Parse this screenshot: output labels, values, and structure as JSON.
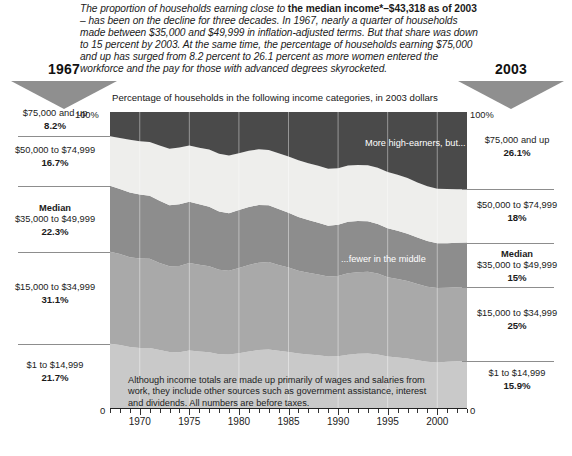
{
  "intro": {
    "part1": "The proportion of households earning close to ",
    "bold1": "the median income*–$43,318 as of 2003",
    "part2": " – has been on the decline for three decades. In 1967, nearly a quarter of households made between $35,000 and $49,999 in inflation-adjusted terms. But that share was down to 15 percent by 2003. At the same time, the percentage of households earning $75,000 and up has surged from 8.2 percent to 26.1 percent as more women entered the workforce and the pay for those with advanced degrees skyrocketed."
  },
  "header": {
    "left_year": "1967",
    "right_year": "2003",
    "caption": "Percentage of households in the following income categories, in 2003 dollars"
  },
  "axis": {
    "top_left": "100%",
    "top_right": "100%",
    "zero_left": "0",
    "zero_right": "0",
    "x_labels": [
      "1970",
      "1975",
      "1980",
      "1985",
      "1990",
      "1995",
      "2000"
    ],
    "x_label_years": [
      1970,
      1975,
      1980,
      1985,
      1990,
      1995,
      2000
    ]
  },
  "annotations": {
    "high_earners": "More high-earners, but...",
    "fewer_middle": "...fewer in the middle",
    "footnote": "Although income totals are made up primarily of wages and salaries from work, they include other sources such as government assistance, interest and dividends. All numbers are before taxes."
  },
  "legend_left": [
    {
      "name": "$75,000 and up",
      "value": "8.2%",
      "median": false
    },
    {
      "name": "$50,000 to $74,999",
      "value": "16.7%",
      "median": false
    },
    {
      "name": "$35,000 to $49,999",
      "value": "22.3%",
      "median": true,
      "median_label": "Median"
    },
    {
      "name": "$15,000 to $34,999",
      "value": "31.1%",
      "median": false
    },
    {
      "name": "$1 to $14,999",
      "value": "21.7%",
      "median": false
    }
  ],
  "legend_right": [
    {
      "name": "$75,000 and up",
      "value": "26.1%",
      "median": false
    },
    {
      "name": "$50,000 to $74,999",
      "value": "18%",
      "median": false
    },
    {
      "name": "$35,000 to $49,999",
      "value": "15%",
      "median": true,
      "median_label": "Median"
    },
    {
      "name": "$15,000 to $34,999",
      "value": "25%",
      "median": false
    },
    {
      "name": "$1 to $14,999",
      "value": "15.9%",
      "median": false
    }
  ],
  "colors": {
    "band_75k_up": "#4a4a4a",
    "band_50k_75k": "#eeeeec",
    "band_35k_50k": "#8d8d8d",
    "band_15k_35k": "#a9a9a9",
    "band_1_15k": "#c9c9c9",
    "triangle": "#8f8f8f",
    "separator": "#8d8d8d"
  },
  "chart_data": {
    "type": "area",
    "title": "Percentage of households in the following income categories, in 2003 dollars",
    "xlabel": "",
    "ylabel": "",
    "stacked": true,
    "normalized_percent": true,
    "ylim": [
      0,
      100
    ],
    "xlim": [
      1967,
      2003
    ],
    "grid": true,
    "legend_position": "outside-left-and-right",
    "x": [
      1967,
      1968,
      1969,
      1970,
      1971,
      1972,
      1973,
      1974,
      1975,
      1976,
      1977,
      1978,
      1979,
      1980,
      1981,
      1982,
      1983,
      1984,
      1985,
      1986,
      1987,
      1988,
      1989,
      1990,
      1991,
      1992,
      1993,
      1994,
      1995,
      1996,
      1997,
      1998,
      1999,
      2000,
      2001,
      2002,
      2003
    ],
    "series": [
      {
        "name": "$1 to $14,999",
        "color": "#c9c9c9",
        "start_value": 21.7,
        "end_value": 15.9,
        "values": [
          21.7,
          21.3,
          20.6,
          20.3,
          20.3,
          19.6,
          18.9,
          18.8,
          19.4,
          19.1,
          18.8,
          18.2,
          18.1,
          18.5,
          19.1,
          19.6,
          19.8,
          19.3,
          18.9,
          18.4,
          18.1,
          17.8,
          17.4,
          17.5,
          18.0,
          18.3,
          18.4,
          18.1,
          17.4,
          17.1,
          16.7,
          16.1,
          15.6,
          15.4,
          15.6,
          15.8,
          15.9
        ]
      },
      {
        "name": "$15,000 to $34,999",
        "color": "#a9a9a9",
        "start_value": 31.1,
        "end_value": 25.0,
        "values": [
          31.1,
          30.7,
          30.3,
          30.2,
          30.1,
          29.4,
          29.0,
          29.2,
          29.6,
          29.3,
          29.1,
          28.5,
          28.3,
          28.8,
          29.2,
          29.5,
          29.5,
          29.0,
          28.6,
          28.0,
          27.6,
          27.3,
          27.0,
          27.1,
          27.5,
          27.6,
          27.6,
          27.3,
          26.8,
          26.5,
          26.2,
          25.8,
          25.4,
          25.1,
          25.0,
          25.0,
          25.0
        ]
      },
      {
        "name": "$35,000 to $49,999",
        "color": "#8d8d8d",
        "start_value": 22.3,
        "end_value": 15.0,
        "values": [
          22.3,
          22.0,
          21.9,
          21.6,
          21.3,
          21.0,
          20.6,
          20.8,
          20.7,
          20.4,
          20.1,
          19.7,
          19.4,
          19.6,
          19.6,
          19.5,
          19.2,
          18.9,
          18.5,
          18.1,
          17.8,
          17.5,
          17.2,
          17.3,
          17.4,
          17.3,
          17.1,
          16.8,
          16.5,
          16.3,
          16.0,
          15.7,
          15.4,
          15.2,
          15.1,
          15.0,
          15.0
        ]
      },
      {
        "name": "$50,000 to $74,999",
        "color": "#eeeeec",
        "start_value": 16.7,
        "end_value": 18.0,
        "values": [
          16.7,
          17.2,
          17.8,
          18.0,
          18.2,
          18.7,
          19.1,
          19.2,
          19.0,
          19.1,
          19.3,
          19.5,
          19.5,
          19.2,
          19.0,
          18.8,
          18.7,
          18.9,
          19.0,
          19.2,
          19.2,
          19.2,
          19.2,
          19.1,
          19.0,
          18.9,
          18.9,
          19.0,
          19.0,
          18.9,
          18.8,
          18.6,
          18.5,
          18.4,
          18.3,
          18.1,
          18.0
        ]
      },
      {
        "name": "$75,000 and up",
        "color": "#4a4a4a",
        "start_value": 8.2,
        "end_value": 26.1,
        "values": [
          8.2,
          8.8,
          9.4,
          9.9,
          10.1,
          11.3,
          12.4,
          12.0,
          11.3,
          12.1,
          12.7,
          14.1,
          14.7,
          13.9,
          13.1,
          12.6,
          12.8,
          13.9,
          15.0,
          16.3,
          17.3,
          18.2,
          19.2,
          19.0,
          18.1,
          17.9,
          18.0,
          18.8,
          20.3,
          21.2,
          22.3,
          23.8,
          25.1,
          25.9,
          26.0,
          26.1,
          26.1
        ]
      }
    ]
  }
}
